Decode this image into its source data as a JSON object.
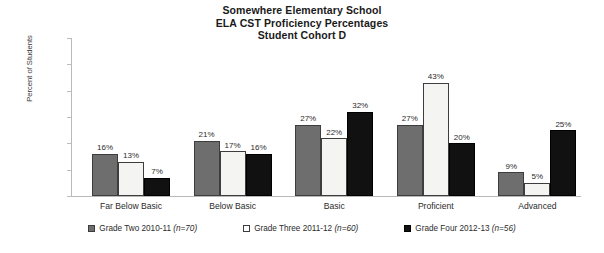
{
  "chart_data": {
    "type": "bar",
    "title": "Somewhere Elementary School ELA CST Proficiency Percentages Student Cohort D",
    "title_lines": [
      "Somewhere Elementary School",
      "ELA CST Proficiency Percentages",
      "Student Cohort D"
    ],
    "xlabel": "",
    "ylabel": "Percent of Students",
    "ylim": [
      0,
      60
    ],
    "ytick_values": [
      0,
      10,
      20,
      30,
      40,
      50,
      60
    ],
    "ytick_labels": [
      "0%",
      "10%",
      "20%",
      "30%",
      "40%",
      "50%",
      "60%"
    ],
    "grid": false,
    "legend_position": "bottom",
    "categories": [
      "Far Below Basic",
      "Below Basic",
      "Basic",
      "Proficient",
      "Advanced"
    ],
    "series": [
      {
        "name": "Grade Two 2010-11 (n=70)",
        "label_main": "Grade Two 2010-11 ",
        "label_n": "(n=70)",
        "color": "#6e6e6e",
        "values": [
          16,
          21,
          27,
          27,
          9
        ],
        "value_labels": [
          "16%",
          "21%",
          "27%",
          "27%",
          "9%"
        ]
      },
      {
        "name": "Grade Three 2011-12 (n=60)",
        "label_main": "Grade Three 2011-12 ",
        "label_n": "(n=60)",
        "color": "#ffffff",
        "values": [
          13,
          17,
          22,
          43,
          5
        ],
        "value_labels": [
          "13%",
          "17%",
          "22%",
          "43%",
          "5%"
        ]
      },
      {
        "name": "Grade Four 2012-13 (n=56)",
        "label_main": "Grade Four 2012-13 ",
        "label_n": "(n=56)",
        "color": "#111111",
        "values": [
          7,
          16,
          32,
          20,
          25
        ],
        "value_labels": [
          "7%",
          "16%",
          "32%",
          "20%",
          "25%"
        ]
      }
    ]
  }
}
